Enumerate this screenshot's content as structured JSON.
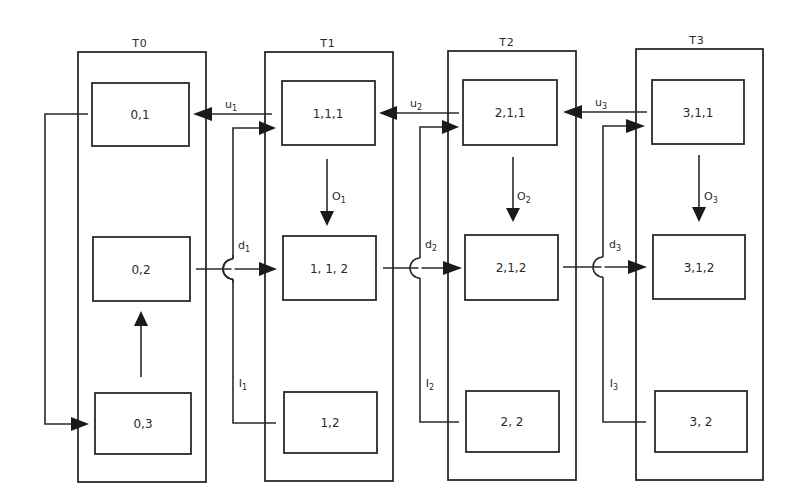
{
  "diagram": {
    "groups": [
      {
        "id": "T0",
        "label": "T0",
        "nodes": [
          {
            "id": "0,1",
            "label": "0,1"
          },
          {
            "id": "0,2",
            "label": "0,2"
          },
          {
            "id": "0,3",
            "label": "0,3"
          }
        ]
      },
      {
        "id": "T1",
        "label": "T1",
        "nodes": [
          {
            "id": "1,1,1",
            "label": "1,1,1"
          },
          {
            "id": "1,1,2",
            "label": "1, 1, 2"
          },
          {
            "id": "1,2",
            "label": "1,2"
          }
        ]
      },
      {
        "id": "T2",
        "label": "T2",
        "nodes": [
          {
            "id": "2,1,1",
            "label": "2,1,1"
          },
          {
            "id": "2,1,2",
            "label": "2,1,2"
          },
          {
            "id": "2,2",
            "label": "2, 2"
          }
        ]
      },
      {
        "id": "T3",
        "label": "T3",
        "nodes": [
          {
            "id": "3,1,1",
            "label": "3,1,1"
          },
          {
            "id": "3,1,2",
            "label": "3,1,2"
          },
          {
            "id": "3,2",
            "label": "3, 2"
          }
        ]
      }
    ],
    "edge_labels": {
      "u1": {
        "base": "u",
        "sub": "1"
      },
      "u2": {
        "base": "u",
        "sub": "2"
      },
      "u3": {
        "base": "u",
        "sub": "3"
      },
      "o1": {
        "base": "O",
        "sub": "1"
      },
      "o2": {
        "base": "O",
        "sub": "2"
      },
      "o3": {
        "base": "O",
        "sub": "3"
      },
      "d1": {
        "base": "d",
        "sub": "1"
      },
      "d2": {
        "base": "d",
        "sub": "2"
      },
      "d3": {
        "base": "d",
        "sub": "3"
      },
      "i1": {
        "base": "I",
        "sub": "1"
      },
      "i2": {
        "base": "I",
        "sub": "2"
      },
      "i3": {
        "base": "I",
        "sub": "3"
      }
    },
    "edges": [
      {
        "from": "1,1,1",
        "to": "0,1",
        "label": "u1"
      },
      {
        "from": "2,1,1",
        "to": "1,1,1",
        "label": "u2"
      },
      {
        "from": "3,1,1",
        "to": "2,1,1",
        "label": "u3"
      },
      {
        "from": "1,1,1",
        "to": "1,1,2",
        "label": "o1"
      },
      {
        "from": "2,1,1",
        "to": "2,1,2",
        "label": "o2"
      },
      {
        "from": "3,1,1",
        "to": "3,1,2",
        "label": "o3"
      },
      {
        "from": "0,2",
        "to": "1,1,2",
        "label": "d1"
      },
      {
        "from": "1,1,2",
        "to": "2,1,2",
        "label": "d2"
      },
      {
        "from": "2,1,2",
        "to": "3,1,2",
        "label": "d3"
      },
      {
        "from": "1,2",
        "to": "1,1,1",
        "label": "i1"
      },
      {
        "from": "2,2",
        "to": "2,1,1",
        "label": "i2"
      },
      {
        "from": "3,2",
        "to": "3,1,1",
        "label": "i3"
      },
      {
        "from": "0,1",
        "to": "0,3",
        "label": ""
      },
      {
        "from": "0,3",
        "to": "0,2",
        "label": ""
      }
    ]
  }
}
